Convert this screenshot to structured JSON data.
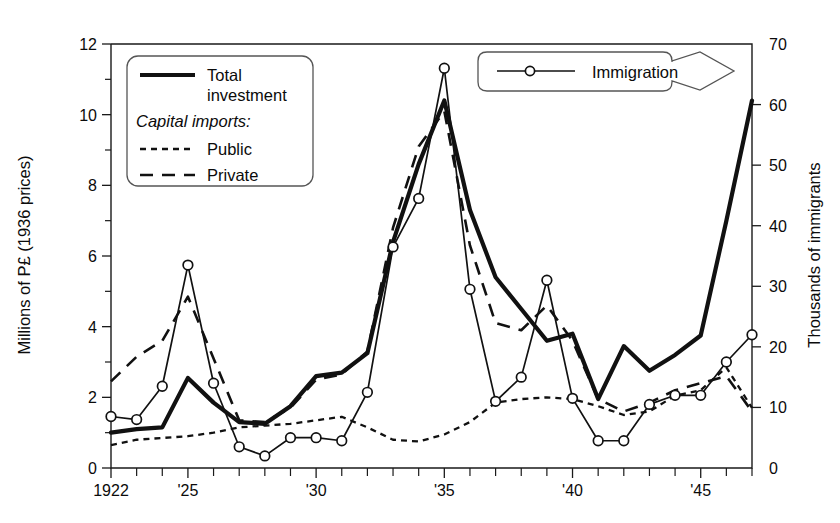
{
  "chart_data": {
    "type": "line",
    "title": "",
    "xlabel": "",
    "ylabel": "Millions of P£ (1936 prices)",
    "y2label": "Thousands of immigrants",
    "xlim": [
      1922,
      1947
    ],
    "ylim": [
      0,
      12
    ],
    "y2lim": [
      0,
      70
    ],
    "grid": false,
    "legend_position": "upper-left",
    "xticks_major": [
      "1922",
      "'25",
      "'30",
      "'35",
      "'40",
      "'45"
    ],
    "xticks_major_years": [
      1922,
      1925,
      1930,
      1935,
      1940,
      1945
    ],
    "yticks_left": [
      "0",
      "2",
      "4",
      "6",
      "8",
      "10",
      "12"
    ],
    "yticks_left_values": [
      0,
      2,
      4,
      6,
      8,
      10,
      12
    ],
    "yticks_left_minor": [
      1,
      3,
      5,
      7,
      9,
      11
    ],
    "yticks_right": [
      "0",
      "10",
      "20",
      "30",
      "40",
      "50",
      "60",
      "70"
    ],
    "yticks_right_values": [
      0,
      10,
      20,
      30,
      40,
      50,
      60,
      70
    ],
    "x": [
      1922,
      1923,
      1924,
      1925,
      1926,
      1927,
      1928,
      1929,
      1930,
      1931,
      1932,
      1933,
      1934,
      1935,
      1936,
      1937,
      1938,
      1939,
      1940,
      1941,
      1942,
      1943,
      1944,
      1945,
      1946,
      1947
    ],
    "series": [
      {
        "name": "Total investment",
        "axis": "left",
        "style": "solid-thick",
        "values": [
          1.0,
          1.1,
          1.15,
          2.55,
          1.85,
          1.3,
          1.25,
          1.75,
          2.6,
          2.7,
          3.25,
          6.4,
          8.6,
          10.4,
          7.3,
          5.4,
          4.5,
          3.6,
          3.8,
          1.95,
          3.45,
          2.75,
          3.2,
          3.75,
          7.0,
          10.4
        ]
      },
      {
        "name": "Public",
        "axis": "left",
        "style": "dotted",
        "values": [
          0.65,
          0.8,
          0.85,
          0.9,
          1.0,
          1.15,
          1.2,
          1.25,
          1.35,
          1.45,
          1.15,
          0.8,
          0.75,
          0.95,
          1.3,
          1.85,
          1.95,
          2.0,
          1.95,
          1.75,
          1.5,
          1.6,
          2.05,
          2.2,
          2.85,
          1.7
        ]
      },
      {
        "name": "Private",
        "axis": "left",
        "style": "dashed",
        "values": [
          2.45,
          3.15,
          3.6,
          4.85,
          3.1,
          1.35,
          1.3,
          1.7,
          2.5,
          2.65,
          3.3,
          6.8,
          9.1,
          10.1,
          6.3,
          4.1,
          3.9,
          4.6,
          3.6,
          1.95,
          1.6,
          1.85,
          2.2,
          2.4,
          2.6,
          1.6
        ]
      },
      {
        "name": "Immigration",
        "axis": "right",
        "style": "solid-marker",
        "values": [
          8.5,
          8.0,
          13.5,
          33.5,
          14.0,
          3.5,
          2.0,
          5.0,
          5.0,
          4.5,
          12.5,
          36.5,
          44.5,
          66.0,
          29.5,
          11.0,
          15.0,
          31.0,
          11.5,
          4.5,
          4.5,
          10.5,
          12.0,
          12.0,
          17.5,
          22.0
        ]
      }
    ]
  },
  "legend": {
    "entries": [
      {
        "label_line1": "Total",
        "label_line2": "investment",
        "style": "solid-thick"
      },
      {
        "label": "Capital imports:",
        "style": "heading"
      },
      {
        "label": "Public",
        "style": "dotted"
      },
      {
        "label": "Private",
        "style": "dashed"
      }
    ]
  },
  "callout": {
    "label": "Immigration"
  },
  "caption": {
    "text": ""
  },
  "colors": {
    "line": "#111111",
    "axis": "#1a1a1a",
    "background": "#ffffff",
    "marker_fill": "#ffffff"
  }
}
